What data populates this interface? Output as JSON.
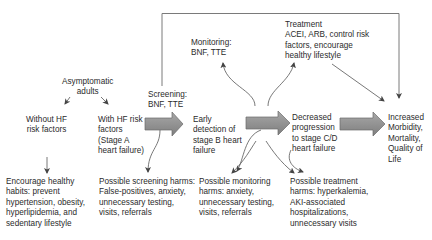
{
  "diagram": {
    "colors": {
      "text": "#2b2b2b",
      "lines": "#555555",
      "block_arrow_fill": "#8f8f8f",
      "block_arrow_stroke": "#6a6a6a",
      "frame": "#7a7a7a"
    },
    "nodes": {
      "asymptomatic": [
        "Asymptomatic",
        "adults"
      ],
      "without_hf": [
        "Without HF",
        "risk factors"
      ],
      "with_hf": [
        "With HF risk",
        "factors",
        "(Stage A",
        "heart failure)"
      ],
      "screening": [
        "Screening:",
        "BNF, TTE"
      ],
      "early_detection": [
        "Early",
        "detection of",
        "stage B heart",
        "failure"
      ],
      "monitoring": [
        "Monitoring:",
        "BNF, TTE"
      ],
      "treatment": [
        "Treatment",
        "ACEI, ARB, control risk",
        "factors, encourage",
        "healthy lifestyle"
      ],
      "decreased": [
        "Decreased",
        "progression",
        "to stage C/D",
        "heart failure"
      ],
      "increased": [
        "Increased",
        "Morbidity,",
        "Mortality,",
        "Quality of",
        "Life"
      ],
      "encourage": [
        "Encourage healthy",
        "habits: prevent",
        "hypertension, obesity,",
        "hyperlipidemia, and",
        "sedentary lifestyle"
      ],
      "screening_harms": [
        "Possible screening harms:",
        "False-positives, anxiety,",
        "unnecessary testing,",
        "visits, referrals"
      ],
      "monitoring_harms": [
        "Possible monitoring",
        "harms: anxiety,",
        "unnecessary testing,",
        "visits, referrals"
      ],
      "treatment_harms": [
        "Possible treatment",
        "harms: hyperkalemia,",
        "AKI-associated",
        "hospitalizations,",
        "unnecessary visits"
      ]
    }
  }
}
